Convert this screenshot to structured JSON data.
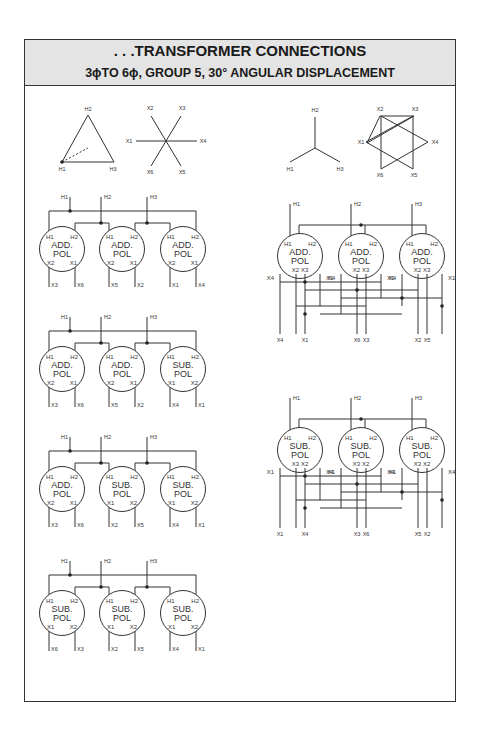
{
  "header": {
    "title": ". . .TRANSFORMER CONNECTIONS",
    "subtitle": "3ϕTO 6ϕ, GROUP 5, 30° ANGULAR DISPLACEMENT"
  },
  "vector_diagrams": {
    "delta_primary": {
      "labels": [
        "H1",
        "H2",
        "H3"
      ]
    },
    "star6_secondary": {
      "labels": [
        "X1",
        "X2",
        "X3",
        "X4",
        "X5",
        "X6"
      ]
    },
    "wye_primary": {
      "labels": [
        "H1",
        "H2",
        "H3"
      ]
    },
    "hexagram_secondary": {
      "labels": [
        "X1",
        "X2",
        "X3",
        "X4",
        "X5",
        "X6"
      ]
    }
  },
  "left_diagrams": [
    {
      "units": [
        {
          "top": [
            "H1",
            "H2"
          ],
          "line1": "ADD.",
          "line2": "POL",
          "bottom": [
            "X2",
            "X1"
          ],
          "outputs": [
            "X3",
            "X6"
          ]
        },
        {
          "top": [
            "H1",
            "H2"
          ],
          "line1": "ADD.",
          "line2": "POL",
          "bottom": [
            "X2",
            "X1"
          ],
          "outputs": [
            "X5",
            "X2"
          ]
        },
        {
          "top": [
            "H1",
            "H2"
          ],
          "line1": "ADD.",
          "line2": "POL",
          "bottom": [
            "X2",
            "X1"
          ],
          "outputs": [
            "X1",
            "X4"
          ]
        }
      ]
    },
    {
      "units": [
        {
          "top": [
            "H1",
            "H2"
          ],
          "line1": "ADD.",
          "line2": "POL",
          "bottom": [
            "X2",
            "X1"
          ],
          "outputs": [
            "X3",
            "X6"
          ]
        },
        {
          "top": [
            "H1",
            "H2"
          ],
          "line1": "ADD.",
          "line2": "POL",
          "bottom": [
            "X2",
            "X1"
          ],
          "outputs": [
            "X5",
            "X2"
          ]
        },
        {
          "top": [
            "H1",
            "H2"
          ],
          "line1": "SUB.",
          "line2": "POL",
          "bottom": [
            "X1",
            "X2"
          ],
          "outputs": [
            "X4",
            "X1"
          ]
        }
      ]
    },
    {
      "units": [
        {
          "top": [
            "H1",
            "H2"
          ],
          "line1": "ADD.",
          "line2": "POL",
          "bottom": [
            "X2",
            "X1"
          ],
          "outputs": [
            "X3",
            "X6"
          ]
        },
        {
          "top": [
            "H1",
            "H2"
          ],
          "line1": "SUB.",
          "line2": "POL",
          "bottom": [
            "X1",
            "X2"
          ],
          "outputs": [
            "X2",
            "X5"
          ]
        },
        {
          "top": [
            "H1",
            "H2"
          ],
          "line1": "SUB.",
          "line2": "POL",
          "bottom": [
            "X1",
            "X2"
          ],
          "outputs": [
            "X4",
            "X1"
          ]
        }
      ]
    },
    {
      "units": [
        {
          "top": [
            "H1",
            "H2"
          ],
          "line1": "SUB.",
          "line2": "POL",
          "bottom": [
            "X1",
            "X2"
          ],
          "outputs": [
            "X6",
            "X3"
          ]
        },
        {
          "top": [
            "H1",
            "H2"
          ],
          "line1": "SUB.",
          "line2": "POL",
          "bottom": [
            "X1",
            "X2"
          ],
          "outputs": [
            "X2",
            "X5"
          ]
        },
        {
          "top": [
            "H1",
            "H2"
          ],
          "line1": "SUB.",
          "line2": "POL",
          "bottom": [
            "X1",
            "X2"
          ],
          "outputs": [
            "X4",
            "X1"
          ]
        }
      ]
    }
  ],
  "left_line_labels": [
    "H1",
    "H2",
    "H3"
  ],
  "right_diagrams": [
    {
      "line_labels": [
        "H1",
        "H2",
        "H3"
      ],
      "units": [
        {
          "top": [
            "H1",
            "H2"
          ],
          "line1": "ADD.",
          "line2": "POL",
          "inner": [
            "X2",
            "X3"
          ],
          "side": [
            "X4",
            "X1"
          ]
        },
        {
          "top": [
            "H1",
            "H2"
          ],
          "line1": "ADD.",
          "line2": "POL",
          "inner": [
            "X2",
            "X3"
          ],
          "side": [
            "X4",
            "X1"
          ]
        },
        {
          "top": [
            "H1",
            "H2"
          ],
          "line1": "ADD.",
          "line2": "POL",
          "inner": [
            "X2",
            "X3"
          ],
          "side": [
            "X4",
            "X1"
          ]
        }
      ],
      "outputs": [
        "X4",
        "X1",
        "X6",
        "X3",
        "X2",
        "X5"
      ]
    },
    {
      "line_labels": [
        "H1",
        "H2",
        "H3"
      ],
      "units": [
        {
          "top": [
            "H1",
            "H2"
          ],
          "line1": "SUB.",
          "line2": "POL",
          "inner": [
            "X3",
            "X2"
          ],
          "side": [
            "X1",
            "X4"
          ]
        },
        {
          "top": [
            "H1",
            "H2"
          ],
          "line1": "SUB.",
          "line2": "POL",
          "inner": [
            "X3",
            "X2"
          ],
          "side": [
            "X1",
            "X4"
          ]
        },
        {
          "top": [
            "H1",
            "H2"
          ],
          "line1": "SUB.",
          "line2": "POL",
          "inner": [
            "X3",
            "X2"
          ],
          "side": [
            "X1",
            "X4"
          ]
        }
      ],
      "outputs": [
        "X1",
        "X4",
        "X3",
        "X6",
        "X5",
        "X2"
      ]
    }
  ]
}
